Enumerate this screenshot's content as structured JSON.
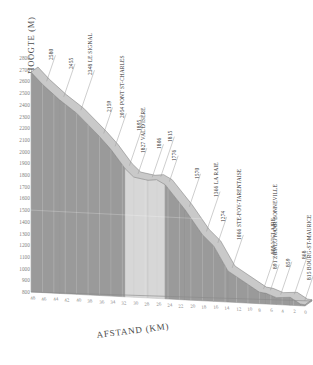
{
  "axes": {
    "y_title": "HOOGTE (M)",
    "x_title": "AFSTAND (KM)",
    "y_ticks": [
      2800,
      2700,
      2600,
      2500,
      2400,
      2300,
      2200,
      2100,
      2000,
      1900,
      1800,
      1700,
      1600,
      1500,
      1400,
      1300,
      1200,
      1100,
      1000,
      900,
      800
    ],
    "x_ticks": [
      48,
      46,
      44,
      42,
      40,
      38,
      36,
      34,
      32,
      30,
      28,
      26,
      24,
      22,
      20,
      18,
      16,
      14,
      12,
      10,
      8,
      6,
      4,
      2,
      0
    ]
  },
  "style": {
    "fill_dark": "#9a9a9a",
    "fill_light": "#d7d7d7",
    "top_face": "#c9c9c9",
    "edge": "#7e7e7e",
    "text": "#2f2f2f",
    "tick_text": "#8a8a8a",
    "background": "#ffffff"
  },
  "chart_data": {
    "type": "area",
    "title": "",
    "subtitle": "",
    "xlabel": "AFSTAND (KM)",
    "ylabel": "HOOGTE (M)",
    "xlim": [
      48,
      0
    ],
    "ylim": [
      800,
      2800
    ],
    "grid": false,
    "legend": "none",
    "x_reversed": true,
    "annotations": [
      {
        "km": 46.0,
        "elev": 2580,
        "label": "2580"
      },
      {
        "km": 43.0,
        "elev": 2455,
        "label": "2455"
      },
      {
        "km": 40.0,
        "elev": 2348,
        "label": "2348 LE SIGNAL"
      },
      {
        "km": 36.0,
        "elev": 2159,
        "label": "2159"
      },
      {
        "km": 34.0,
        "elev": 2054,
        "label": "2054 PONT ST-CHARLES"
      },
      {
        "km": 31.5,
        "elev": 1895,
        "label": "1895"
      },
      {
        "km": 30.0,
        "elev": 1827,
        "label": "1827 VAL D'ISÈRE"
      },
      {
        "km": 27.5,
        "elev": 1806,
        "label": "1806"
      },
      {
        "km": 26.0,
        "elev": 1815,
        "label": "1815"
      },
      {
        "km": 24.5,
        "elev": 1776,
        "label": "1776"
      },
      {
        "km": 21.0,
        "elev": 1570,
        "label": "1570"
      },
      {
        "km": 18.0,
        "elev": 1366,
        "label": "1366 LA RAIE"
      },
      {
        "km": 16.0,
        "elev": 1274,
        "label": "1274"
      },
      {
        "km": 13.5,
        "elev": 1066,
        "label": "1066 STE-FOY-TARENTAISE"
      },
      {
        "km": 8.0,
        "elev": 899,
        "label": "899 VICLAIRE"
      },
      {
        "km": 6.8,
        "elev": 891,
        "label": "891 ZIJWEG NAAR BONNEVILLE"
      },
      {
        "km": 5.0,
        "elev": 859,
        "label": "859"
      },
      {
        "km": 2.6,
        "elev": 868,
        "label": "868"
      },
      {
        "km": 0.8,
        "elev": 815,
        "label": "815 BOURG-ST-MAURICE"
      }
    ],
    "x": [
      48,
      46,
      43,
      40,
      36,
      34,
      31.5,
      30,
      27.5,
      26,
      24.5,
      21,
      18,
      16,
      13.5,
      8,
      6.8,
      5,
      2.6,
      0.8,
      0
    ],
    "y": [
      2680,
      2580,
      2455,
      2348,
      2159,
      2054,
      1895,
      1827,
      1806,
      1815,
      1776,
      1570,
      1366,
      1274,
      1066,
      899,
      891,
      859,
      868,
      815,
      810
    ]
  }
}
